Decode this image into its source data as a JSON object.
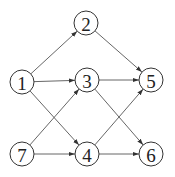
{
  "nodes": [
    {
      "id": "1",
      "label": "1"
    },
    {
      "id": "2",
      "label": "2"
    },
    {
      "id": "3",
      "label": "3"
    },
    {
      "id": "4",
      "label": "4"
    },
    {
      "id": "5",
      "label": "5"
    },
    {
      "id": "6",
      "label": "6"
    },
    {
      "id": "7",
      "label": "7"
    }
  ],
  "edges": [
    {
      "from": "1",
      "to": "2"
    },
    {
      "from": "2",
      "to": "5"
    },
    {
      "from": "1",
      "to": "3"
    },
    {
      "from": "3",
      "to": "5"
    },
    {
      "from": "1",
      "to": "4"
    },
    {
      "from": "7",
      "to": "3"
    },
    {
      "from": "3",
      "to": "6"
    },
    {
      "from": "4",
      "to": "5"
    },
    {
      "from": "7",
      "to": "4"
    },
    {
      "from": "4",
      "to": "6"
    }
  ],
  "colors": {
    "stroke": "#333333",
    "text": "#222222"
  }
}
